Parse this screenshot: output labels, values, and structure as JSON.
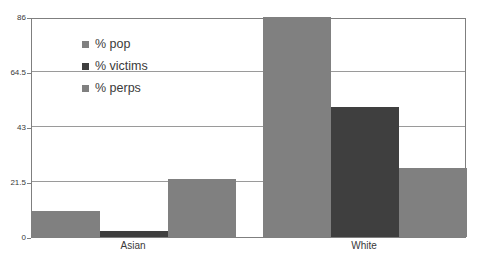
{
  "chart_data": {
    "type": "bar",
    "title": "",
    "xlabel": "",
    "ylabel": "",
    "categories": [
      "Asian",
      "White"
    ],
    "series": [
      {
        "name": "% pop",
        "values": [
          10,
          86
        ],
        "color": "#808080"
      },
      {
        "name": "% victims",
        "values": [
          2.5,
          51
        ],
        "color": "#3f3f3f"
      },
      {
        "name": "% perps",
        "values": [
          22.5,
          27
        ],
        "color": "#808080"
      }
    ],
    "ylim": [
      0,
      86
    ],
    "yticks": [
      0,
      21.5,
      43,
      64.5,
      86
    ],
    "ytick_labels": [
      "0",
      "21.5",
      "43",
      "64.5",
      "86"
    ],
    "grid": true,
    "legend_position": "upper-left-inside",
    "note": "The % pop bar for White is clipped at the top of the axis (86)."
  },
  "legend": {
    "items": [
      {
        "label": "% pop",
        "color": "#808080"
      },
      {
        "label": "% victims",
        "color": "#3f3f3f"
      },
      {
        "label": "% perps",
        "color": "#808080"
      }
    ]
  },
  "axes": {
    "y": {
      "ticks": [
        "86",
        "64.5",
        "43",
        "21.5",
        "0"
      ]
    },
    "x": {
      "ticks": [
        "Asian",
        "White"
      ]
    }
  },
  "colors": {
    "frame": "#7f7f7f",
    "gridline": "#9a9a9a",
    "background": "#ffffff",
    "text": "#3a3a3a",
    "series_light": "#808080",
    "series_dark": "#3f3f3f"
  }
}
